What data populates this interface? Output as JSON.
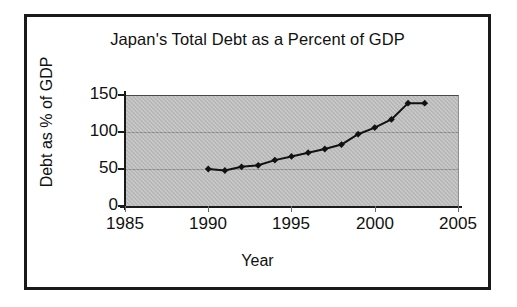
{
  "chart_data": {
    "type": "line",
    "title": "Japan's Total Debt as a Percent of GDP",
    "xlabel": "Year",
    "ylabel": "Debt as % of GDP",
    "xlim": [
      1985,
      2005
    ],
    "ylim": [
      0,
      150
    ],
    "xticks": [
      1985,
      1990,
      1995,
      2000,
      2005
    ],
    "yticks": [
      0,
      50,
      100,
      150
    ],
    "grid": "horizontal",
    "legend": "none",
    "marker": "diamond",
    "marker_color": "#111111",
    "line_color": "#111111",
    "plot_background": "#b7b7b7",
    "x": [
      1990,
      1991,
      1992,
      1993,
      1994,
      1995,
      1996,
      1997,
      1998,
      1999,
      2000,
      2001,
      2002,
      2003
    ],
    "values": [
      50,
      48,
      53,
      55,
      62,
      67,
      72,
      77,
      83,
      97,
      106,
      117,
      139,
      139
    ]
  },
  "axis": {
    "x_tick_labels": [
      "1985",
      "1990",
      "1995",
      "2000",
      "2005"
    ],
    "y_tick_labels": [
      "0",
      "50",
      "100",
      "150"
    ]
  }
}
